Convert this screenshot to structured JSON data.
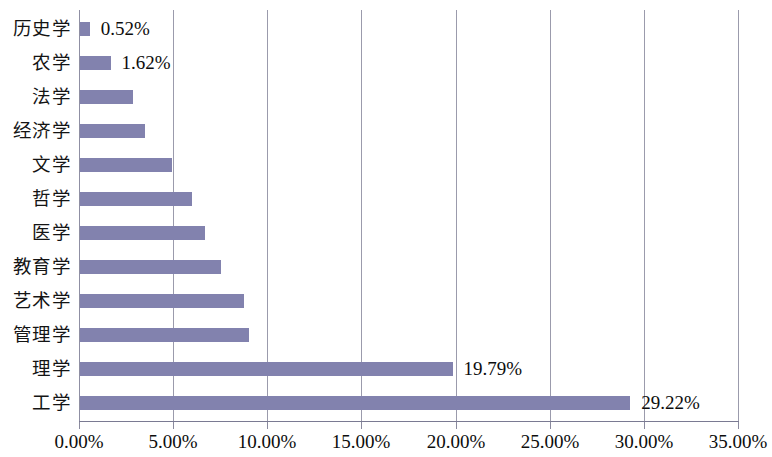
{
  "chart_data": {
    "type": "bar",
    "orientation": "horizontal",
    "title": "",
    "subtitle": "",
    "xlabel": "",
    "ylabel": "",
    "xlim": [
      0,
      35
    ],
    "xtick_labels": [
      "0.00%",
      "5.00%",
      "10.00%",
      "15.00%",
      "20.00%",
      "25.00%",
      "30.00%",
      "35.00%"
    ],
    "xticks": [
      0,
      5,
      10,
      15,
      20,
      25,
      30,
      35
    ],
    "grid": true,
    "legend": null,
    "series_color": "#8282ae",
    "categories": [
      "历史学",
      "农学",
      "法学",
      "经济学",
      "文学",
      "哲学",
      "医学",
      "教育学",
      "艺术学",
      "管理学",
      "理学",
      "工学"
    ],
    "values": [
      0.52,
      1.62,
      2.8,
      3.45,
      4.89,
      5.93,
      6.64,
      7.49,
      8.69,
      8.99,
      19.79,
      29.22
    ],
    "data_labels": [
      "0.52%",
      "1.62%",
      "",
      "",
      "",
      "",
      "",
      "",
      "",
      "",
      "19.79%",
      "29.22%"
    ],
    "points": [
      {
        "category": "历史学",
        "value": 0.52,
        "label": "0.52%"
      },
      {
        "category": "农学",
        "value": 1.62,
        "label": "1.62%"
      },
      {
        "category": "法学",
        "value": 2.8,
        "label": ""
      },
      {
        "category": "经济学",
        "value": 3.45,
        "label": ""
      },
      {
        "category": "文学",
        "value": 4.89,
        "label": ""
      },
      {
        "category": "哲学",
        "value": 5.93,
        "label": ""
      },
      {
        "category": "医学",
        "value": 6.64,
        "label": ""
      },
      {
        "category": "教育学",
        "value": 7.49,
        "label": ""
      },
      {
        "category": "艺术学",
        "value": 8.69,
        "label": ""
      },
      {
        "category": "管理学",
        "value": 8.99,
        "label": ""
      },
      {
        "category": "理学",
        "value": 19.79,
        "label": "19.79%"
      },
      {
        "category": "工学",
        "value": 29.22,
        "label": "29.22%"
      }
    ]
  }
}
